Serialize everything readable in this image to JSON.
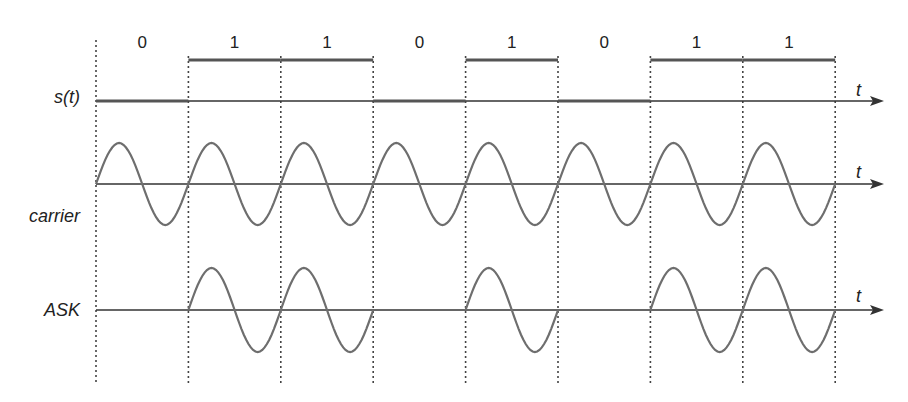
{
  "diagram": {
    "bits": [
      "0",
      "1",
      "1",
      "0",
      "1",
      "0",
      "1",
      "1"
    ],
    "labels": {
      "signal": "s(t)",
      "carrier": "carrier",
      "ask": "ASK",
      "time_axis": "t"
    },
    "colors": {
      "signal_line": "#555555",
      "wave": "#6e6e6e",
      "axis": "#333333",
      "divider": "#444444",
      "text": "#222222"
    }
  }
}
